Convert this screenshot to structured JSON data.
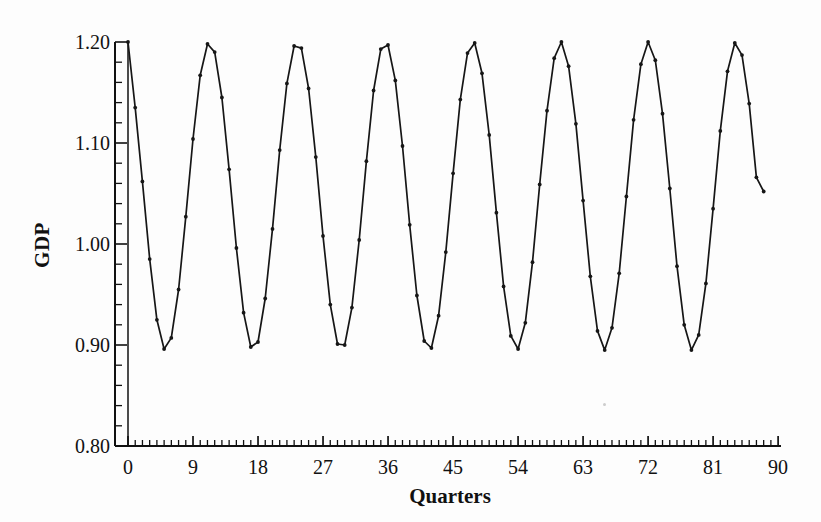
{
  "figure": {
    "x_axis_title": "Quarters",
    "y_axis_title": "GDP",
    "x_tick_labels": [
      "0",
      "9",
      "18",
      "27",
      "36",
      "45",
      "54",
      "63",
      "72",
      "81",
      "90"
    ],
    "y_tick_labels": [
      "0.80",
      "0.90",
      "1.00",
      "1.10",
      "1.20"
    ]
  },
  "chart_data": {
    "type": "line",
    "title": "",
    "xlabel": "Quarters",
    "ylabel": "GDP",
    "xlim": [
      -1.8,
      90.4
    ],
    "ylim": [
      0.8,
      1.2
    ],
    "x_major_ticks": [
      0,
      9,
      18,
      27,
      36,
      45,
      54,
      63,
      72,
      81,
      90
    ],
    "x_minor_step": 1,
    "y_major_ticks": [
      0.8,
      0.9,
      1.0,
      1.1,
      1.2
    ],
    "y_minor_step": 0.02,
    "grid": "off",
    "legend": "none",
    "marker": "dot",
    "line_color": "#161616",
    "axis_color": "#111111",
    "background_color": "#fdfdfd",
    "zero_line_x": 0,
    "x_start": 0,
    "x_step": 1,
    "series": [
      {
        "name": "GDP",
        "values": [
          1.2,
          1.135,
          1.062,
          0.985,
          0.925,
          0.896,
          0.907,
          0.955,
          1.027,
          1.104,
          1.167,
          1.198,
          1.19,
          1.145,
          1.074,
          0.996,
          0.932,
          0.898,
          0.903,
          0.946,
          1.015,
          1.093,
          1.159,
          1.196,
          1.194,
          1.154,
          1.086,
          1.008,
          0.94,
          0.901,
          0.9,
          0.937,
          1.004,
          1.082,
          1.152,
          1.193,
          1.197,
          1.162,
          1.097,
          1.019,
          0.949,
          0.904,
          0.897,
          0.929,
          0.992,
          1.07,
          1.143,
          1.189,
          1.199,
          1.169,
          1.108,
          1.031,
          0.958,
          0.909,
          0.896,
          0.922,
          0.982,
          1.059,
          1.132,
          1.184,
          1.2,
          1.176,
          1.119,
          1.043,
          0.968,
          0.914,
          0.895,
          0.917,
          0.971,
          1.047,
          1.123,
          1.178,
          1.2,
          1.182,
          1.129,
          1.055,
          0.978,
          0.92,
          0.895,
          0.91,
          0.961,
          1.035,
          1.112,
          1.171,
          1.199,
          1.187,
          1.139,
          1.066,
          1.052
        ]
      }
    ]
  }
}
